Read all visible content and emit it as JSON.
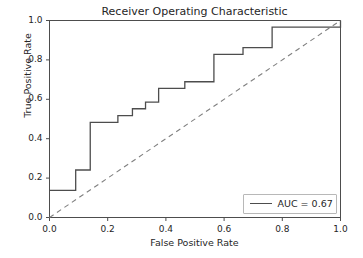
{
  "chart_data": {
    "type": "line",
    "title": "Receiver Operating Characteristic",
    "xlabel": "False Positive Rate",
    "ylabel": "True Positive Rate",
    "xlim": [
      0.0,
      1.0
    ],
    "ylim": [
      0.0,
      1.0
    ],
    "grid": false,
    "legend_position": "lower right",
    "xticks": [
      0.0,
      0.2,
      0.4,
      0.6,
      0.8,
      1.0
    ],
    "xtick_labels": [
      "0.0",
      "0.2",
      "0.4",
      "0.6",
      "0.8",
      "1.0"
    ],
    "yticks": [
      0.0,
      0.2,
      0.4,
      0.6,
      0.8,
      1.0
    ],
    "ytick_labels": [
      "0.0",
      "0.2",
      "0.4",
      "0.6",
      "0.8",
      "1.0"
    ],
    "series": [
      {
        "name": "AUC = 0.67",
        "style": "solid",
        "color": "#4d4d4d",
        "drawstyle": "steps-post",
        "x": [
          0.0,
          0.09,
          0.09,
          0.14,
          0.14,
          0.235,
          0.235,
          0.285,
          0.285,
          0.33,
          0.33,
          0.375,
          0.375,
          0.465,
          0.465,
          0.565,
          0.565,
          0.665,
          0.665,
          0.765,
          0.765,
          1.0,
          1.0
        ],
        "y": [
          0.138,
          0.138,
          0.241,
          0.241,
          0.483,
          0.483,
          0.517,
          0.517,
          0.552,
          0.552,
          0.586,
          0.586,
          0.655,
          0.655,
          0.689,
          0.689,
          0.828,
          0.828,
          0.862,
          0.862,
          0.966,
          0.966,
          1.0
        ]
      },
      {
        "name": "chance-diagonal",
        "style": "dashed",
        "color": "#808080",
        "x": [
          0.0,
          1.0
        ],
        "y": [
          0.0,
          1.0
        ]
      }
    ],
    "legend_entries": [
      {
        "label": "AUC = 0.67",
        "style": "solid",
        "color": "#4d4d4d"
      }
    ],
    "auc_value": "0.67"
  },
  "colors": {
    "curve": "#4d4d4d",
    "diagonal": "#808080",
    "axes": "#4d4d4d",
    "background": "#ffffff",
    "text": "#262626",
    "legend_border": "#b8b8b8"
  }
}
